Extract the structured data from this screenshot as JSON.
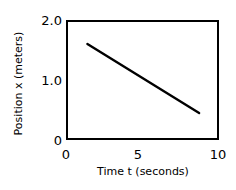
{
  "chart_data": {
    "type": "line",
    "title": "",
    "xlabel": "Time t (seconds)",
    "ylabel": "Position x (meters)",
    "xlim": [
      0,
      10
    ],
    "ylim": [
      0,
      2.0
    ],
    "xticks": [
      "0",
      "5",
      "10"
    ],
    "xtick_values": [
      0,
      5,
      10
    ],
    "yticks": [
      "0",
      "1.0",
      "2.0"
    ],
    "ytick_values": [
      0,
      1.0,
      2.0
    ],
    "grid": false,
    "legend": "none",
    "line_color": "#000000",
    "series": [
      {
        "name": "position",
        "x": [
          1.4,
          8.7
        ],
        "y": [
          1.6,
          0.45
        ]
      }
    ],
    "annotations": []
  },
  "figure": {
    "background": "#ffffff",
    "frame_color": "#000000"
  }
}
